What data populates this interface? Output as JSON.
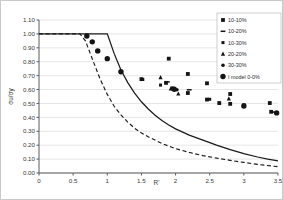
{
  "chart_data": {
    "type": "scatter",
    "title": "",
    "xlabel": "R'",
    "ylabel": "σu/σy",
    "xlim": [
      0,
      3.5
    ],
    "ylim": [
      0,
      1.1
    ],
    "xticks": [
      "0",
      "0.5",
      "1",
      "1.5",
      "2",
      "2.5",
      "3",
      "3.5"
    ],
    "xtick_values": [
      0,
      0.5,
      1,
      1.5,
      2,
      2.5,
      3,
      3.5
    ],
    "yticks": [
      "0.00",
      "0.10",
      "0.20",
      "0.30",
      "0.40",
      "0.50",
      "0.60",
      "0.70",
      "0.80",
      "0.90",
      "1.00",
      "1.10"
    ],
    "ytick_values": [
      0,
      0.1,
      0.2,
      0.3,
      0.4,
      0.5,
      0.6,
      0.7,
      0.8,
      0.9,
      1.0,
      1.1
    ],
    "grid": "horizontal",
    "legend_position": "top-right",
    "series": [
      {
        "name": "10-10%",
        "marker": "square",
        "color": "#141414",
        "points": [
          [
            1.5,
            0.675
          ],
          [
            1.9,
            0.822
          ],
          [
            1.86,
            0.648
          ],
          [
            2.18,
            0.712
          ],
          [
            2.18,
            0.575
          ],
          [
            2.46,
            0.645
          ],
          [
            2.46,
            0.528
          ],
          [
            2.64,
            0.503
          ],
          [
            2.8,
            0.568
          ],
          [
            2.8,
            0.497
          ],
          [
            3.0,
            0.487
          ],
          [
            3.38,
            0.503
          ],
          [
            3.4,
            0.44
          ]
        ]
      },
      {
        "name": "10-20%",
        "marker": "dash",
        "color": "#141414",
        "points": [
          [
            1.88,
            0.655
          ],
          [
            2.2,
            0.598
          ],
          [
            3.42,
            0.438
          ]
        ]
      },
      {
        "name": "10-30%",
        "marker": "small-square",
        "color": "#141414",
        "points": [
          [
            1.52,
            0.672
          ],
          [
            1.78,
            0.632
          ],
          [
            1.95,
            0.612
          ],
          [
            2.5,
            0.53
          ]
        ]
      },
      {
        "name": "20-20%",
        "marker": "triangle",
        "color": "#141414",
        "points": [
          [
            1.78,
            0.688
          ],
          [
            1.93,
            0.607
          ],
          [
            2.04,
            0.57
          ],
          [
            2.78,
            0.535
          ]
        ]
      },
      {
        "name": "30-30%",
        "marker": "circle-small",
        "color": "#141414",
        "points": [
          [
            1.96,
            0.603
          ],
          [
            2.02,
            0.598
          ],
          [
            3.0,
            0.483
          ]
        ]
      },
      {
        "name": "I model 0-0%",
        "marker": "circle",
        "color": "#141414",
        "points": [
          [
            0.7,
            0.985
          ],
          [
            0.78,
            0.943
          ],
          [
            0.86,
            0.878
          ],
          [
            1.0,
            0.822
          ],
          [
            1.2,
            0.728
          ],
          [
            1.98,
            0.602
          ],
          [
            3.0,
            0.482
          ],
          [
            3.48,
            0.432
          ]
        ]
      }
    ],
    "curves": [
      {
        "name": "solid-model-curve",
        "style": "solid",
        "color": "#1a1a1a",
        "points": [
          [
            0,
            1.0
          ],
          [
            0.5,
            1.0
          ],
          [
            1.0,
            1.0
          ],
          [
            1.1,
            0.86
          ],
          [
            1.2,
            0.74
          ],
          [
            1.3,
            0.65
          ],
          [
            1.4,
            0.575
          ],
          [
            1.5,
            0.512
          ],
          [
            1.6,
            0.46
          ],
          [
            1.7,
            0.415
          ],
          [
            1.8,
            0.378
          ],
          [
            1.9,
            0.345
          ],
          [
            2.0,
            0.317
          ],
          [
            2.2,
            0.272
          ],
          [
            2.4,
            0.236
          ],
          [
            2.6,
            0.2
          ],
          [
            2.8,
            0.168
          ],
          [
            3.0,
            0.14
          ],
          [
            3.2,
            0.115
          ],
          [
            3.35,
            0.1
          ],
          [
            3.5,
            0.088
          ]
        ]
      },
      {
        "name": "dashed-model-curve",
        "style": "dashed",
        "color": "#1a1a1a",
        "points": [
          [
            0,
            1.0
          ],
          [
            0.6,
            1.0
          ],
          [
            0.68,
            0.95
          ],
          [
            0.75,
            0.86
          ],
          [
            0.82,
            0.77
          ],
          [
            0.9,
            0.67
          ],
          [
            1.0,
            0.565
          ],
          [
            1.1,
            0.48
          ],
          [
            1.2,
            0.418
          ],
          [
            1.3,
            0.366
          ],
          [
            1.4,
            0.322
          ],
          [
            1.5,
            0.288
          ],
          [
            1.6,
            0.26
          ],
          [
            1.8,
            0.212
          ],
          [
            2.0,
            0.175
          ],
          [
            2.2,
            0.148
          ],
          [
            2.4,
            0.125
          ],
          [
            2.6,
            0.107
          ],
          [
            2.8,
            0.091
          ],
          [
            3.0,
            0.076
          ],
          [
            3.2,
            0.062
          ],
          [
            3.5,
            0.045
          ]
        ]
      }
    ]
  }
}
